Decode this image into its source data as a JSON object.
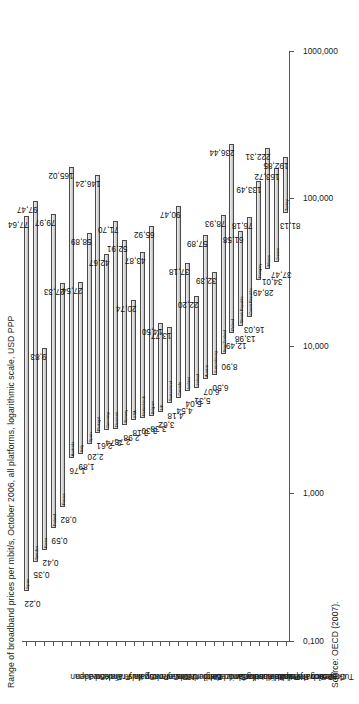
{
  "chart": {
    "title": "Range of broadband prices per mbit/s, October 2006, all platforms, logarithmic scale, USD PPP",
    "source": "Source: OECD (2007)."
  },
  "chart_data": {
    "type": "bar",
    "title": "Range of broadband prices per mbit/s, October 2006, all platforms, logarithmic scale, USD PPP",
    "subtitle": "",
    "xlabel": "",
    "ylabel": "USD PPP per mbit/s (logarithmic scale)",
    "scale": "log",
    "orientation": "floating-range-bars",
    "grid": false,
    "legend": "none",
    "annotation": "Source: OECD (2007).",
    "axis_ticks": [
      "0,100",
      "1,000",
      "10,000",
      "100,000",
      "1000,000"
    ],
    "axis_tick_values": [
      0.1,
      1,
      10,
      100,
      1000
    ],
    "ylim": [
      0.1,
      1000
    ],
    "categories": [
      "Japan",
      "Sweden",
      "Korea",
      "Finland",
      "France",
      "Australia",
      "Italy",
      "Spain",
      "Portugal",
      "Germany",
      "Denmark",
      "Norway",
      "USA",
      "Netherlands",
      "Belgium",
      "UK",
      "Switzerland",
      "Canada",
      "Iceland",
      "Ireland",
      "Austria",
      "Luxembourg",
      "New Zealand",
      "Poland",
      "Slovak Republic",
      "Czech Republic",
      "Hungary",
      "Mexico",
      "Greece",
      "Turkey"
    ],
    "series": [
      {
        "name": "minimum price",
        "values": [
          0.22,
          0.35,
          0.42,
          0.59,
          0.82,
          1.76,
          1.89,
          2.2,
          2.61,
          2.74,
          2.78,
          2.98,
          3.18,
          3.3,
          3.38,
          3.62,
          4.18,
          4.54,
          5.04,
          5.31,
          6.07,
          6.5,
          8.9,
          12.49,
          13.98,
          16.03,
          28.49,
          34.01,
          37.47,
          81.13
        ]
      },
      {
        "name": "maximum price",
        "values": [
          77.64,
          97.47,
          9.83,
          79.97,
          27.33,
          27.54,
          58.89,
          42.67,
          146.24,
          71.7,
          52.91,
          20.74,
          43.87,
          65.92,
          14.5,
          13.77,
          90.47,
          37.18,
          22.2,
          57.89,
          32.39,
          78.93,
          57.89,
          236.44,
          61.58,
          76.18,
          133.49,
          222.31,
          163.72,
          192.85
        ]
      }
    ],
    "bars": [
      {
        "country": "Japan",
        "min": 0.22,
        "max": 77.64,
        "min_label": "0,22",
        "max_label": "77,64"
      },
      {
        "country": "Sweden",
        "min": 0.35,
        "max": 97.47,
        "min_label": "0,35",
        "max_label": "97,47"
      },
      {
        "country": "Korea",
        "min": 0.42,
        "max": 9.83,
        "min_label": "0,42",
        "max_label": "9,83"
      },
      {
        "country": "Finland",
        "min": 0.59,
        "max": 79.97,
        "min_label": "0,59",
        "max_label": "79,97"
      },
      {
        "country": "France",
        "min": 0.82,
        "max": 27.33,
        "min_label": "0,82",
        "max_label": "27,33"
      },
      {
        "country": "Australia",
        "min": 1.76,
        "max": 165.02,
        "min_label": "1,76",
        "max_label": "165,02"
      },
      {
        "country": "Italy",
        "min": 1.89,
        "max": 27.54,
        "min_label": "1,89",
        "max_label": "27,54"
      },
      {
        "country": "Spain",
        "min": 2.2,
        "max": 58.89,
        "min_label": "2,20",
        "max_label": "58,89"
      },
      {
        "country": "Portugal",
        "min": 2.61,
        "max": 146.24,
        "min_label": "2,61",
        "max_label": "146,24"
      },
      {
        "country": "Germany",
        "min": 2.74,
        "max": 42.67,
        "min_label": "2,74",
        "max_label": "42,67"
      },
      {
        "country": "Denmark",
        "min": 2.78,
        "max": 71.7,
        "min_label": "2,78",
        "max_label": "71,70"
      },
      {
        "country": "Norway",
        "min": 2.98,
        "max": 52.91,
        "min_label": "2,98",
        "max_label": "52,91"
      },
      {
        "country": "USA",
        "min": 3.18,
        "max": 20.74,
        "min_label": "3,18",
        "max_label": "20,74"
      },
      {
        "country": "Netherlands",
        "min": 3.3,
        "max": 43.87,
        "min_label": "3,30",
        "max_label": "43,87"
      },
      {
        "country": "Belgium",
        "min": 3.38,
        "max": 65.92,
        "min_label": "3,38",
        "max_label": "65,92"
      },
      {
        "country": "UK",
        "min": 3.62,
        "max": 14.5,
        "min_label": "3,62",
        "max_label": "14,50"
      },
      {
        "country": "Switzerland",
        "min": 4.18,
        "max": 13.77,
        "min_label": "4,18",
        "max_label": "13,77"
      },
      {
        "country": "Canada",
        "min": 4.54,
        "max": 90.47,
        "min_label": "4,54",
        "max_label": "90,47"
      },
      {
        "country": "Iceland",
        "min": 5.04,
        "max": 37.18,
        "min_label": "5,04",
        "max_label": "37,18"
      },
      {
        "country": "Ireland",
        "min": 5.31,
        "max": 22.2,
        "min_label": "5,31",
        "max_label": "22,20"
      },
      {
        "country": "Austria",
        "min": 6.07,
        "max": 57.89,
        "min_label": "6,07",
        "max_label": "57,89"
      },
      {
        "country": "Luxembourg",
        "min": 6.5,
        "max": 32.39,
        "min_label": "6,50",
        "max_label": "32,39"
      },
      {
        "country": "New Zealand",
        "min": 8.9,
        "max": 78.93,
        "min_label": "8,90",
        "max_label": "78,93"
      },
      {
        "country": "Poland",
        "min": 12.49,
        "max": 236.44,
        "min_label": "12,49",
        "max_label": "236,44"
      },
      {
        "country": "Slovak Republic",
        "min": 13.98,
        "max": 61.58,
        "min_label": "13,98",
        "max_label": "61,58"
      },
      {
        "country": "Czech Republic",
        "min": 16.03,
        "max": 76.18,
        "min_label": "16,03",
        "max_label": "76,18"
      },
      {
        "country": "Hungary",
        "min": 28.49,
        "max": 133.49,
        "min_label": "28,49",
        "max_label": "133,49"
      },
      {
        "country": "Mexico",
        "min": 34.01,
        "max": 222.31,
        "min_label": "34,01",
        "max_label": "222,31"
      },
      {
        "country": "Greece",
        "min": 37.47,
        "max": 163.72,
        "min_label": "37,47",
        "max_label": "163,72"
      },
      {
        "country": "Turkey",
        "min": 81.13,
        "max": 192.85,
        "min_label": "81,13",
        "max_label": "192,85"
      }
    ]
  }
}
